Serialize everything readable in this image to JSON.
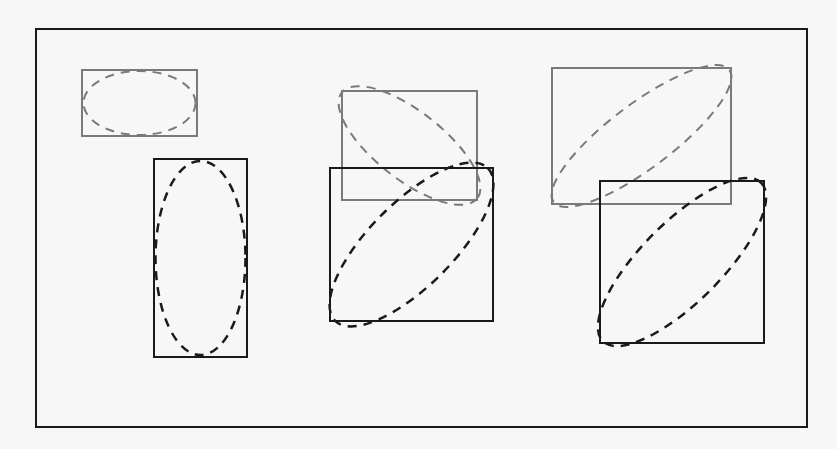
{
  "canvas": {
    "width": 837,
    "height": 449,
    "background": "#f7f7f7"
  },
  "colors": {
    "black": "#1a1a1a",
    "gray": "#7a7a7a"
  },
  "frame": {
    "x": 36,
    "y": 29,
    "w": 771,
    "h": 398,
    "stroke": "#1a1a1a",
    "width": 2
  },
  "groups": [
    {
      "name": "pair-horizontal-to-vertical",
      "boxes": [
        {
          "name": "box-gray-wide",
          "x": 82,
          "y": 70,
          "w": 115,
          "h": 66,
          "stroke": "#7a7a7a",
          "ellipse": {
            "cx": 139.5,
            "cy": 103,
            "rx": 56,
            "ry": 32,
            "rot": 0
          }
        },
        {
          "name": "box-black-tall",
          "x": 154,
          "y": 159,
          "w": 93,
          "h": 198,
          "stroke": "#1a1a1a",
          "ellipse": {
            "cx": 200.5,
            "cy": 258,
            "rx": 45,
            "ry": 97,
            "rot": 0
          }
        }
      ]
    },
    {
      "name": "pair-diagonal-flip",
      "boxes": [
        {
          "name": "box-gray-mid",
          "x": 342,
          "y": 91,
          "w": 135,
          "h": 109,
          "stroke": "#7a7a7a",
          "ellipse": {
            "cx": 409.5,
            "cy": 145.5,
            "rx": 86,
            "ry": 34,
            "rot": 38
          }
        },
        {
          "name": "box-black-mid",
          "x": 330,
          "y": 168,
          "w": 163,
          "h": 153,
          "stroke": "#1a1a1a",
          "ellipse": {
            "cx": 411.5,
            "cy": 244.5,
            "rx": 108,
            "ry": 42,
            "rot": -45
          }
        }
      ]
    },
    {
      "name": "pair-diagonal-shift",
      "boxes": [
        {
          "name": "box-gray-right",
          "x": 552,
          "y": 68,
          "w": 179,
          "h": 136,
          "stroke": "#7a7a7a",
          "ellipse": {
            "cx": 641.5,
            "cy": 136,
            "rx": 110,
            "ry": 32,
            "rot": -37
          }
        },
        {
          "name": "box-black-right",
          "x": 600,
          "y": 181,
          "w": 164,
          "h": 162,
          "stroke": "#1a1a1a",
          "ellipse": {
            "cx": 682,
            "cy": 262,
            "rx": 112,
            "ry": 40,
            "rot": -45
          }
        }
      ]
    }
  ]
}
